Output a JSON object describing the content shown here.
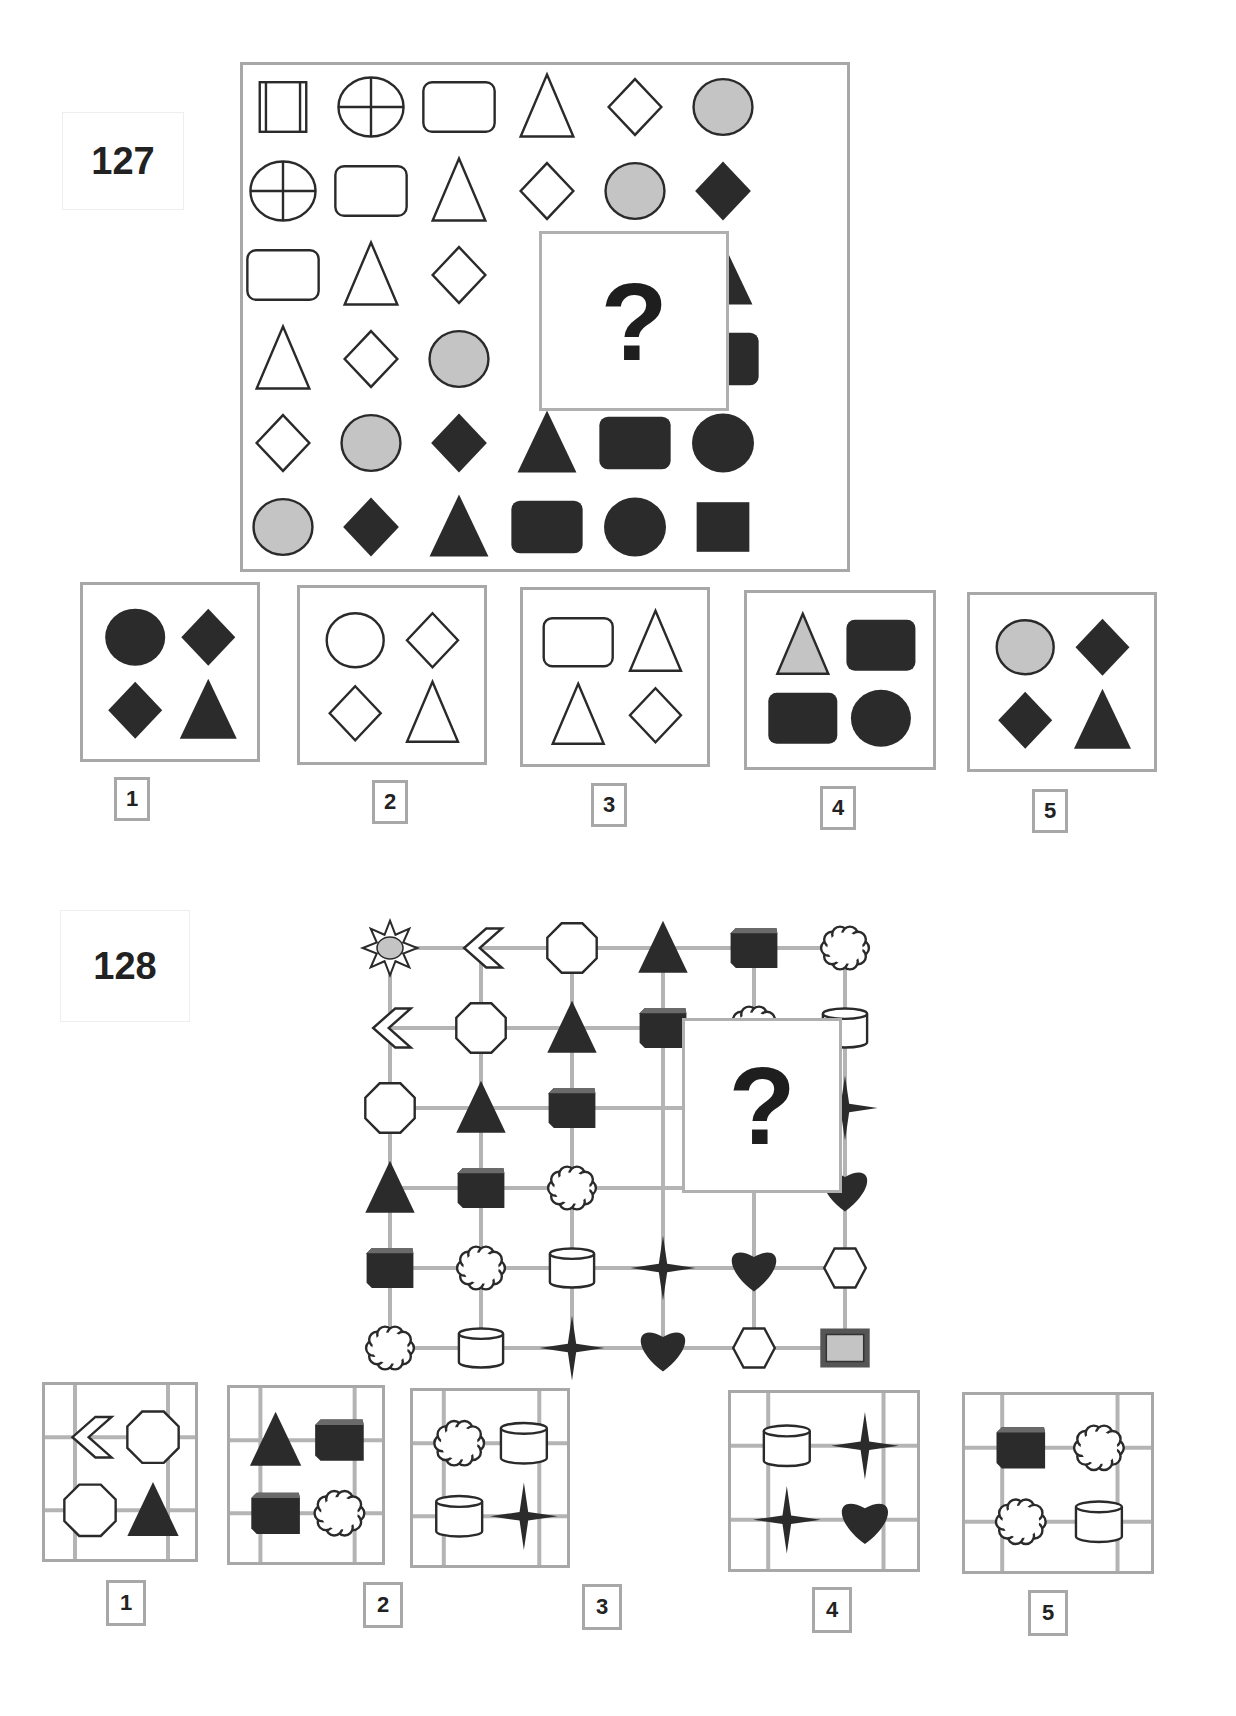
{
  "puzzle127": {
    "number": "127",
    "question_mark": "?",
    "grid": [
      [
        "square-double-bars",
        "circle-cross",
        "rounded-rect",
        "triangle",
        "diamond",
        "circle-gray"
      ],
      [
        "circle-cross",
        "rounded-rect",
        "triangle",
        "diamond",
        "circle-gray",
        "diamond-dark"
      ],
      [
        "rounded-rect",
        "triangle",
        "diamond",
        "?",
        "?",
        "triangle-dark"
      ],
      [
        "triangle",
        "diamond",
        "circle-gray",
        "?",
        "?",
        "rounded-rect-dark"
      ],
      [
        "diamond",
        "circle-gray",
        "diamond-dark",
        "triangle-dark",
        "rounded-rect-dark",
        "circle-dark"
      ],
      [
        "circle-gray",
        "diamond-dark",
        "triangle-dark",
        "rounded-rect-dark",
        "circle-dark",
        "square-dark"
      ]
    ],
    "options": [
      {
        "label": "1",
        "shapes": [
          "circle-dark",
          "diamond-dark",
          "diamond-dark",
          "triangle-dark"
        ]
      },
      {
        "label": "2",
        "shapes": [
          "circle",
          "diamond",
          "diamond",
          "triangle"
        ]
      },
      {
        "label": "3",
        "shapes": [
          "rounded-rect",
          "triangle",
          "triangle",
          "diamond"
        ]
      },
      {
        "label": "4",
        "shapes": [
          "triangle-gray",
          "rounded-rect-dark",
          "rounded-rect-dark",
          "circle-dark"
        ]
      },
      {
        "label": "5",
        "shapes": [
          "circle-gray",
          "diamond-dark",
          "diamond-dark",
          "triangle-dark"
        ]
      }
    ]
  },
  "puzzle128": {
    "number": "128",
    "question_mark": "?",
    "grid": [
      [
        "sun",
        "chevron",
        "octagon",
        "triangle-dark",
        "cube",
        "cloud"
      ],
      [
        "chevron",
        "octagon",
        "triangle-dark",
        "cube",
        "cloud",
        "cylinder"
      ],
      [
        "octagon",
        "triangle-dark",
        "cube",
        "?",
        "?",
        "star4"
      ],
      [
        "triangle-dark",
        "cube",
        "cloud",
        "?",
        "?",
        "heart"
      ],
      [
        "cube",
        "cloud",
        "cylinder",
        "star4",
        "heart",
        "hexagon"
      ],
      [
        "cloud",
        "cylinder",
        "star4",
        "heart",
        "hexagon",
        "frame-gray"
      ]
    ],
    "options": [
      {
        "label": "1",
        "shapes": [
          "chevron",
          "octagon",
          "octagon",
          "triangle-dark"
        ]
      },
      {
        "label": "2",
        "shapes": [
          "triangle-dark",
          "cube",
          "cube",
          "cloud"
        ]
      },
      {
        "label": "3",
        "shapes": [
          "cloud",
          "cylinder",
          "cylinder",
          "star4"
        ]
      },
      {
        "label": "4",
        "shapes": [
          "cylinder",
          "star4",
          "star4",
          "heart"
        ]
      },
      {
        "label": "5",
        "shapes": [
          "cube",
          "cloud",
          "cloud",
          "cylinder"
        ]
      }
    ]
  },
  "colors": {
    "dark": "#2b2b2b",
    "mid_dark": "#3a3a3a",
    "gray_fill": "#c4c4c4",
    "border": "#a8a8a8",
    "stroke": "#2a2a2a",
    "grid_line": "#b4b4b4"
  }
}
